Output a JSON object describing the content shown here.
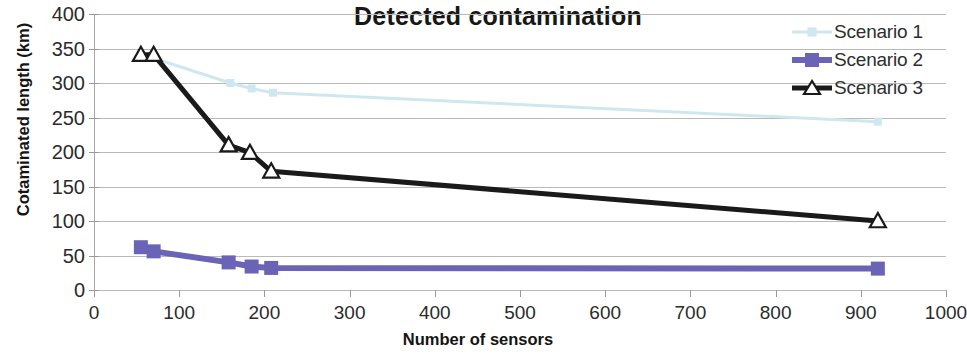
{
  "chart_data": {
    "type": "line",
    "title": "Detected contamination",
    "xlabel": "Number of sensors",
    "ylabel": "Cotaminated length (km)",
    "xlim": [
      0,
      1000
    ],
    "ylim": [
      0,
      400
    ],
    "xticks": [
      0,
      100,
      200,
      300,
      400,
      500,
      600,
      700,
      800,
      900,
      1000
    ],
    "yticks": [
      0,
      50,
      100,
      150,
      200,
      250,
      300,
      350,
      400
    ],
    "grid": "horizontal",
    "legend_position": "top-right",
    "series": [
      {
        "name": "Scenario 1",
        "color": "#cfe8ef",
        "marker": "square",
        "x": [
          55,
          160,
          185,
          210,
          920
        ],
        "y": [
          342,
          300,
          292,
          286,
          244
        ]
      },
      {
        "name": "Scenario 2",
        "color": "#6b63b5",
        "marker": "square",
        "x": [
          55,
          70,
          158,
          185,
          208,
          920
        ],
        "y": [
          62,
          56,
          40,
          34,
          32,
          31
        ]
      },
      {
        "name": "Scenario 3",
        "color": "#1a1a1a",
        "marker": "triangle",
        "x": [
          55,
          70,
          158,
          183,
          208,
          920
        ],
        "y": [
          341,
          341,
          210,
          199,
          172,
          100
        ]
      }
    ]
  }
}
